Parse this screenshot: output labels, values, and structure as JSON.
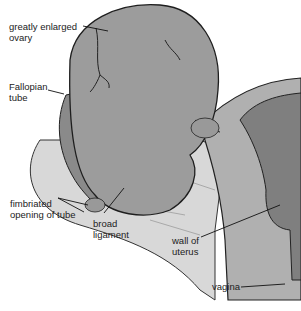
{
  "figure": {
    "colors": {
      "ovary_fill": "#9c9c9c",
      "ligament_fill": "#d6d6d6",
      "uterus_wall_fill": "#a8a8a8",
      "uterus_cavity_fill": "#7e7e7e",
      "outline": "#222222",
      "background": "#ffffff"
    }
  },
  "labels": {
    "ovary": "greatly enlarged\novary",
    "fallopian_tube": "Fallopian\ntube",
    "fimbriated_opening": "fimbriated\nopening of tube",
    "broad_ligament": "broad\nligament",
    "wall_of_uterus": "wall of\nuterus",
    "vagina": "vagina"
  }
}
